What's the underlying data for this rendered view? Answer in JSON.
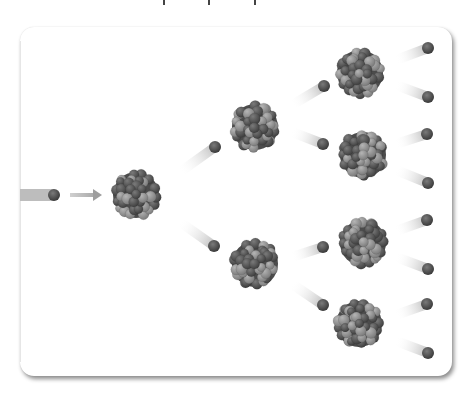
{
  "diagram": {
    "colors": {
      "background": "#ffffff",
      "frame": "#ffffff",
      "neutron": "#4a4a4a",
      "nucleus_dark": "#555555",
      "nucleus_light": "#9a9a9a",
      "trail": "#bdbdbd",
      "arrow": "#9e9e9e"
    },
    "incoming_neutron": {
      "x": 54,
      "y": 195,
      "trail_from_x": 20
    },
    "arrow": {
      "x1": 70,
      "x2": 102,
      "y": 195
    },
    "nuclei": [
      {
        "id": "gen1",
        "x": 136,
        "y": 195
      },
      {
        "id": "gen2-top",
        "x": 255,
        "y": 127
      },
      {
        "id": "gen2-bottom",
        "x": 255,
        "y": 264
      },
      {
        "id": "gen3-a",
        "x": 360,
        "y": 73
      },
      {
        "id": "gen3-b",
        "x": 363,
        "y": 155
      },
      {
        "id": "gen3-c",
        "x": 363,
        "y": 243
      },
      {
        "id": "gen3-d",
        "x": 359,
        "y": 324
      }
    ],
    "neutrons": [
      {
        "x": 215,
        "y": 147,
        "fx": 180,
        "fy": 172
      },
      {
        "x": 214,
        "y": 246,
        "fx": 180,
        "fy": 222
      },
      {
        "x": 324,
        "y": 86,
        "fx": 292,
        "fy": 105
      },
      {
        "x": 323,
        "y": 144,
        "fx": 292,
        "fy": 132
      },
      {
        "x": 323,
        "y": 247,
        "fx": 292,
        "fy": 257
      },
      {
        "x": 323,
        "y": 305,
        "fx": 292,
        "fy": 284
      },
      {
        "x": 428,
        "y": 48,
        "fx": 396,
        "fy": 60
      },
      {
        "x": 428,
        "y": 97,
        "fx": 396,
        "fy": 85
      },
      {
        "x": 427,
        "y": 134,
        "fx": 396,
        "fy": 144
      },
      {
        "x": 428,
        "y": 183,
        "fx": 396,
        "fy": 170
      },
      {
        "x": 427,
        "y": 220,
        "fx": 396,
        "fy": 231
      },
      {
        "x": 428,
        "y": 269,
        "fx": 396,
        "fy": 257
      },
      {
        "x": 427,
        "y": 304,
        "fx": 396,
        "fy": 315
      },
      {
        "x": 428,
        "y": 353,
        "fx": 396,
        "fy": 341
      }
    ]
  }
}
